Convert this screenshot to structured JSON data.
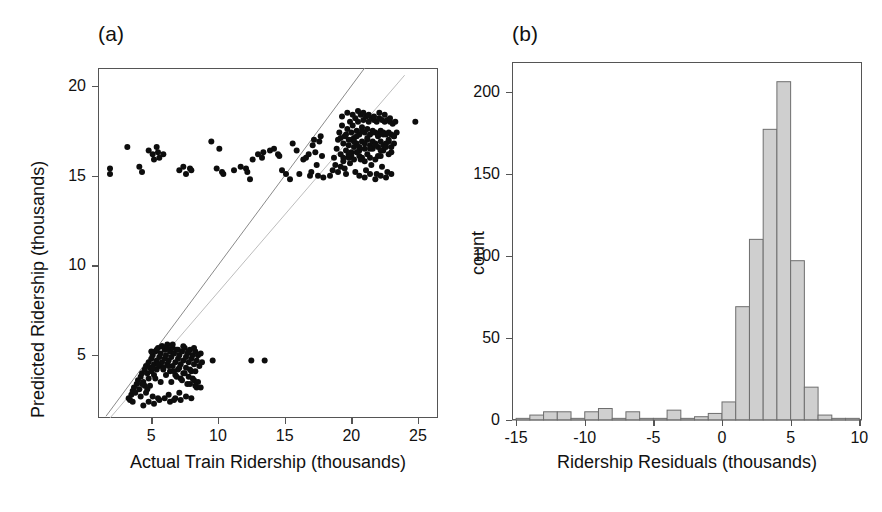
{
  "figure": {
    "panels": [
      {
        "tag": "(a)",
        "name": "scatter-panel"
      },
      {
        "tag": "(b)",
        "name": "histogram-panel"
      }
    ]
  },
  "chart_data": [
    {
      "type": "scatter",
      "panel": "(a)",
      "title": "",
      "xlabel": "Actual Train Ridership (thousands)",
      "ylabel": "Predicted Ridership (thousands)",
      "xlim": [
        1.0,
        26.5
      ],
      "ylim": [
        1.5,
        21.0
      ],
      "xticks": [
        5,
        10,
        15,
        20,
        25
      ],
      "yticks": [
        5,
        10,
        15,
        20
      ],
      "grid": false,
      "legend": "none",
      "annotations": [
        "identity reference line y = x",
        "second lighter reference line"
      ],
      "reference_lines": [
        {
          "name": "identity",
          "x1": 1.6,
          "y1": 1.6,
          "x2": 21.0,
          "y2": 21.0,
          "color": "#8a8a8a"
        },
        {
          "name": "lower-slope-line",
          "x1": 1.9,
          "y1": 1.5,
          "x2": 24.0,
          "y2": 20.6,
          "color": "#bdbdbd"
        }
      ],
      "series": [
        {
          "name": "low-ridership-cluster",
          "x": [
            3.3,
            3.4,
            3.5,
            3.6,
            3.6,
            3.7,
            3.8,
            3.9,
            4.0,
            4.1,
            4.2,
            4.2,
            4.3,
            4.4,
            4.5,
            4.5,
            4.6,
            4.7,
            4.8,
            4.8,
            4.9,
            5.0,
            5.0,
            5.1,
            5.2,
            5.2,
            5.3,
            5.4,
            5.4,
            5.5,
            5.6,
            5.6,
            5.7,
            5.8,
            5.8,
            5.9,
            6.0,
            6.0,
            6.1,
            6.2,
            6.2,
            6.3,
            6.4,
            6.4,
            6.5,
            6.6,
            6.6,
            6.7,
            6.8,
            6.8,
            6.9,
            7.0,
            7.0,
            7.1,
            7.2,
            7.2,
            7.3,
            7.4,
            7.4,
            7.5,
            7.6,
            7.6,
            7.7,
            7.8,
            7.8,
            7.9,
            8.0,
            8.0,
            8.1,
            8.2,
            8.2,
            8.3,
            8.4,
            8.5,
            8.6,
            8.7,
            8.8,
            4.6,
            4.9,
            5.3,
            5.7,
            6.1,
            6.5,
            6.9,
            7.3,
            7.7,
            8.1,
            8.5,
            5.0,
            5.4,
            5.8,
            6.2,
            6.6,
            7.0,
            7.4,
            7.8,
            8.2,
            4.4,
            4.8,
            5.2,
            5.6,
            6.0,
            6.4,
            6.8,
            7.2,
            7.6,
            8.0,
            8.4,
            5.1,
            5.5,
            5.9,
            6.3,
            6.7,
            7.1,
            7.5,
            7.9,
            8.3,
            4.3,
            4.7,
            5.1,
            5.5,
            6.3,
            6.7,
            7.1,
            7.9,
            8.3,
            8.7
          ],
          "y": [
            2.6,
            2.5,
            2.8,
            3.0,
            2.4,
            3.2,
            2.9,
            3.4,
            3.6,
            3.1,
            3.8,
            2.7,
            4.0,
            3.5,
            4.2,
            3.3,
            4.4,
            4.0,
            4.6,
            3.7,
            4.3,
            4.8,
            4.1,
            5.0,
            4.5,
            3.9,
            5.2,
            4.7,
            4.2,
            5.4,
            4.9,
            4.4,
            5.1,
            4.6,
            5.5,
            4.3,
            5.3,
            4.8,
            5.0,
            4.5,
            5.6,
            4.7,
            5.2,
            4.1,
            4.9,
            5.4,
            4.4,
            5.1,
            4.6,
            3.9,
            5.3,
            4.8,
            4.2,
            5.0,
            4.5,
            3.7,
            5.2,
            4.7,
            4.0,
            5.4,
            4.9,
            4.3,
            5.1,
            4.6,
            3.8,
            5.3,
            4.8,
            4.1,
            5.0,
            4.5,
            3.6,
            5.2,
            4.7,
            5.0,
            4.4,
            5.1,
            4.6,
            2.9,
            3.3,
            3.7,
            3.5,
            3.9,
            3.5,
            3.8,
            3.6,
            3.4,
            3.7,
            3.5,
            5.2,
            5.3,
            5.5,
            5.4,
            5.6,
            5.3,
            5.5,
            5.2,
            5.4,
            2.2,
            2.4,
            2.3,
            2.5,
            2.6,
            2.4,
            2.6,
            2.5,
            2.7,
            2.6,
            3.2,
            4.3,
            4.5,
            4.2,
            4.4,
            4.1,
            4.3,
            4.0,
            4.2,
            4.1,
            3.4,
            3.1,
            2.7,
            2.6,
            2.8,
            2.5,
            2.9,
            3.4,
            3.3,
            3.2
          ],
          "color": "#0d0d0d"
        },
        {
          "name": "low-ridership-outliers",
          "x": [
            9.6,
            12.5,
            13.5
          ],
          "y": [
            4.7,
            4.7,
            4.7
          ],
          "color": "#0d0d0d"
        },
        {
          "name": "high-ridership-cluster",
          "x": [
            18.4,
            18.6,
            18.7,
            18.8,
            18.9,
            19.0,
            19.0,
            19.1,
            19.2,
            19.2,
            19.3,
            19.4,
            19.4,
            19.5,
            19.6,
            19.6,
            19.7,
            19.8,
            19.8,
            19.9,
            20.0,
            20.0,
            20.1,
            20.2,
            20.2,
            20.3,
            20.4,
            20.4,
            20.5,
            20.6,
            20.6,
            20.7,
            20.8,
            20.8,
            20.9,
            21.0,
            21.0,
            21.1,
            21.2,
            21.2,
            21.3,
            21.4,
            21.4,
            21.5,
            21.6,
            21.6,
            21.7,
            21.8,
            21.8,
            21.9,
            22.0,
            22.0,
            22.1,
            22.2,
            22.2,
            22.3,
            22.4,
            22.4,
            22.5,
            22.6,
            22.6,
            22.7,
            22.8,
            22.8,
            22.9,
            23.0,
            23.0,
            23.1,
            23.2,
            23.2,
            23.3,
            23.4,
            19.3,
            19.7,
            20.1,
            20.5,
            20.9,
            21.3,
            21.7,
            22.1,
            22.5,
            22.9,
            19.5,
            19.9,
            20.3,
            20.7,
            21.1,
            21.5,
            21.9,
            22.3,
            22.7,
            20.0,
            20.4,
            20.8,
            21.2,
            21.6,
            22.0,
            22.4,
            22.8,
            19.2,
            19.6,
            20.0,
            20.4,
            20.8,
            21.2,
            21.6,
            22.0,
            22.4,
            22.8,
            23.2,
            19.8,
            20.2,
            20.6,
            21.0,
            21.4,
            21.8,
            22.2,
            22.6,
            23.0,
            20.6,
            21.0,
            21.4,
            21.8,
            22.2,
            22.6,
            23.0,
            19.4,
            19.8,
            20.2,
            20.6,
            21.0,
            21.4,
            21.8,
            22.2
          ],
          "y": [
            15.0,
            15.3,
            16.0,
            15.6,
            16.5,
            17.0,
            15.2,
            17.4,
            16.2,
            15.5,
            17.8,
            16.8,
            15.8,
            17.2,
            16.4,
            15.1,
            17.6,
            17.0,
            16.0,
            18.0,
            17.4,
            16.3,
            17.8,
            17.1,
            16.6,
            18.2,
            17.5,
            16.8,
            18.0,
            17.3,
            16.4,
            18.4,
            17.7,
            16.9,
            18.1,
            17.4,
            16.5,
            18.3,
            17.6,
            17.0,
            18.0,
            17.3,
            16.7,
            18.2,
            17.5,
            16.9,
            18.1,
            17.4,
            16.8,
            18.0,
            17.3,
            16.6,
            18.2,
            17.5,
            16.9,
            18.1,
            17.4,
            16.7,
            18.0,
            17.3,
            16.8,
            18.1,
            17.4,
            16.9,
            18.0,
            17.3,
            16.6,
            17.9,
            17.2,
            16.8,
            18.0,
            17.4,
            18.3,
            18.5,
            18.4,
            18.6,
            18.5,
            18.4,
            18.3,
            18.5,
            18.4,
            18.2,
            15.4,
            15.7,
            15.2,
            15.9,
            15.3,
            15.6,
            15.1,
            15.5,
            15.2,
            16.1,
            16.3,
            16.0,
            16.2,
            16.5,
            16.1,
            16.4,
            16.2,
            17.1,
            17.3,
            17.0,
            17.2,
            17.5,
            17.1,
            17.4,
            17.2,
            17.3,
            17.0,
            17.2,
            16.7,
            16.9,
            16.6,
            16.8,
            16.5,
            16.7,
            16.4,
            16.6,
            16.3,
            15.0,
            14.9,
            15.1,
            14.8,
            15.0,
            14.9,
            15.1,
            16.0,
            16.2,
            15.9,
            16.1,
            15.8,
            16.0,
            15.9,
            16.1
          ],
          "color": "#0d0d0d"
        },
        {
          "name": "high-ridership-far-point",
          "x": [
            24.8
          ],
          "y": [
            18.0
          ],
          "color": "#0d0d0d"
        },
        {
          "name": "misclassified-points",
          "x": [
            1.9,
            1.9,
            3.2,
            4.1,
            4.3,
            4.8,
            5.1,
            5.2,
            5.4,
            5.5,
            5.6,
            5.9,
            7.1,
            7.4,
            7.6,
            7.9,
            8.0,
            9.5,
            9.9,
            10.3,
            10.4,
            11.2,
            11.7,
            12.1,
            12.4,
            12.6,
            13.0,
            13.3,
            13.4,
            13.9,
            14.2,
            14.5,
            14.8,
            15.1,
            15.4,
            15.6,
            15.9,
            16.1,
            16.4,
            16.6,
            16.8,
            17.0,
            17.1,
            17.2,
            17.3,
            17.4,
            17.5,
            17.6,
            17.7,
            17.8,
            17.9,
            12.2,
            14.6,
            16.9,
            10.1
          ],
          "y": [
            15.4,
            15.1,
            16.6,
            15.5,
            15.2,
            16.4,
            16.2,
            15.9,
            16.6,
            16.3,
            16.0,
            16.2,
            15.3,
            15.5,
            15.1,
            15.4,
            15.3,
            16.9,
            15.4,
            15.2,
            15.1,
            15.3,
            15.5,
            15.4,
            14.8,
            15.9,
            16.2,
            16.0,
            16.3,
            16.4,
            16.5,
            16.2,
            15.3,
            15.1,
            14.8,
            16.8,
            16.4,
            15.1,
            15.9,
            16.0,
            16.2,
            15.2,
            16.7,
            17.0,
            16.3,
            15.6,
            15.0,
            16.9,
            17.2,
            16.1,
            14.9,
            15.2,
            16.1,
            15.0,
            16.5
          ],
          "color": "#0d0d0d"
        }
      ]
    },
    {
      "type": "bar",
      "panel": "(b)",
      "title": "",
      "xlabel": "Ridership Residuals (thousands)",
      "ylabel": "count",
      "xlim": [
        -15.3,
        10.2
      ],
      "ylim": [
        0,
        218
      ],
      "xticks": [
        -15,
        -10,
        -5,
        0,
        5,
        10
      ],
      "yticks": [
        0,
        50,
        100,
        150,
        200
      ],
      "grid": false,
      "legend": "none",
      "bin_width": 1,
      "bin_starts": [
        -15,
        -14,
        -13,
        -12,
        -11,
        -10,
        -9,
        -8,
        -7,
        -6,
        -5,
        -4,
        -3,
        -2,
        -1,
        0,
        1,
        2,
        3,
        4,
        5,
        6,
        7,
        8,
        9
      ],
      "categories": [
        "-15",
        "-14",
        "-13",
        "-12",
        "-11",
        "-10",
        "-9",
        "-8",
        "-7",
        "-6",
        "-5",
        "-4",
        "-3",
        "-2",
        "-1",
        "0",
        "1",
        "2",
        "3",
        "4",
        "5",
        "6",
        "7",
        "8",
        "9"
      ],
      "values": [
        1,
        3,
        5,
        5,
        1,
        5,
        7,
        1,
        5,
        1,
        1,
        6,
        1,
        2,
        4,
        11,
        69,
        110,
        177,
        206,
        97,
        20,
        3,
        1,
        1
      ],
      "peak_value": 206,
      "peak_bin": "3 to 4",
      "bar_fill": "#cfcfcf",
      "bar_stroke": "#6e6e6e"
    }
  ]
}
